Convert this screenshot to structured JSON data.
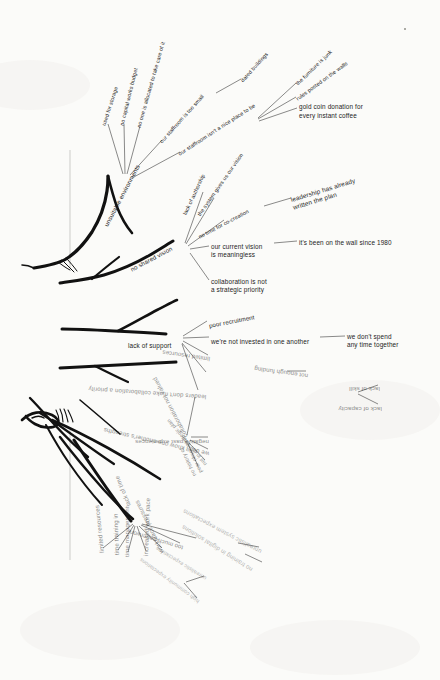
{
  "diagram": {
    "ink_color": "#1a1a1a",
    "paper_color": "#fbfbf9"
  },
  "branches": {
    "unsuitable_environments": {
      "label": "unsuitable environments",
      "children": [
        {
          "label": "used for storage"
        },
        {
          "label": "no capital works budget"
        },
        {
          "label": "no one is allocated to take care of it"
        },
        {
          "label": "our staffroom is too small",
          "child": "dated buildings"
        },
        {
          "label": "our staffroom isn't a nice place to be",
          "children": [
            "the furniture is junk",
            "rules posted on the walls",
            "gold coin donation for\never y instant coffee"
          ]
        }
      ]
    },
    "no_shared_vision": {
      "label": "no shared vision",
      "children": [
        {
          "label": "lack of authorship"
        },
        {
          "label": "the system gives us our vision"
        },
        {
          "label": "no time for co-creation",
          "child": "leadership has already\nwritten the plan"
        },
        {
          "label": "our current vision\nis meaningless",
          "child": "it's been on the wall since 1980"
        },
        {
          "label": "collaboration is not\na strategic priority"
        }
      ]
    },
    "lack_of_support": {
      "label": "lack of support",
      "children": [
        {
          "label": "poor recruitment"
        },
        {
          "label": "we're not invested in one another",
          "child": "we don't spend\nany time together"
        },
        {
          "label": "limited resources",
          "child": "not enough funding"
        },
        {
          "label": "leaders don't make collaboration a priority",
          "children": [
            "lack of skill",
            "lack of capacity"
          ]
        }
      ]
    },
    "collaboration_not_valued": {
      "label": "collaboration not valued",
      "children": [
        {
          "label": "negative past experiences"
        },
        {
          "label": "we don't know one another's strengths"
        },
        {
          "label": "not in our strategic plan"
        },
        {
          "label": "no history of\npeer observation"
        }
      ]
    },
    "lack_of_time": {
      "label": "lack of time",
      "children": [
        {
          "label": "limited resources"
        },
        {
          "label": "time training in"
        },
        {
          "label": "time management"
        },
        {
          "label": "increased work pace"
        },
        {
          "label": "workplace pressures"
        },
        {
          "label": "too much paperwork",
          "child": "unrealistic system expectations"
        },
        {
          "label": "no training in digital solutions"
        },
        {
          "label": "unrealistic expectations"
        },
        {
          "label": "high community expectations"
        }
      ]
    }
  },
  "gold_coin_text_line1": "gold coin donation for",
  "gold_coin_text_line2": "every instant coffee"
}
